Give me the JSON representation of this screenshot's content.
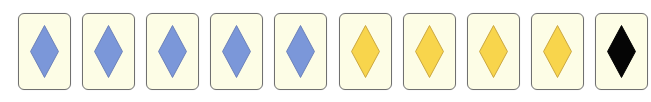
{
  "game": {
    "description": "Row of symbol cards",
    "card_count": 10
  },
  "colors": {
    "card_background": "#fdfde6",
    "card_border": "#707070",
    "blue_fill": "#7b97d9",
    "blue_stroke": "#6a7fb8",
    "yellow_fill": "#f8d54c",
    "yellow_stroke": "#c9a43c",
    "black_fill": "#050505",
    "black_stroke": "#000000"
  },
  "cards": [
    {
      "shape": "diamond",
      "color": "blue"
    },
    {
      "shape": "diamond",
      "color": "blue"
    },
    {
      "shape": "diamond",
      "color": "blue"
    },
    {
      "shape": "diamond",
      "color": "blue"
    },
    {
      "shape": "diamond",
      "color": "blue"
    },
    {
      "shape": "diamond",
      "color": "yellow"
    },
    {
      "shape": "diamond",
      "color": "yellow"
    },
    {
      "shape": "diamond",
      "color": "yellow"
    },
    {
      "shape": "diamond",
      "color": "yellow"
    },
    {
      "shape": "diamond",
      "color": "black"
    }
  ]
}
